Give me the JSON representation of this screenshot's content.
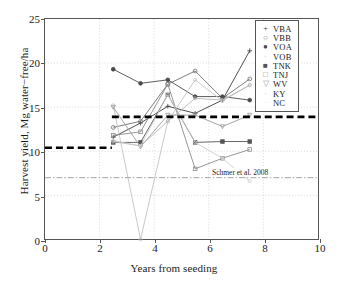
{
  "chart_data": {
    "type": "line",
    "title": "",
    "xlabel": "Years from seeding",
    "ylabel": "Harvest yield, Mg water−free/ha",
    "xlim": [
      0,
      10
    ],
    "ylim": [
      0,
      25
    ],
    "xticks": [
      0,
      2,
      4,
      6,
      8,
      10
    ],
    "yticks": [
      0,
      5,
      10,
      15,
      20,
      25
    ],
    "grid": true,
    "legend_position": "upper right",
    "series": [
      {
        "name": "VBA",
        "marker": "plus",
        "color": "#3a3a3a",
        "x": [
          2.5,
          3.5,
          4.5,
          5.5,
          6.5,
          7.5
        ],
        "y": [
          11.6,
          13.2,
          15.1,
          14.3,
          15.8,
          21.4
        ]
      },
      {
        "name": "VBB",
        "marker": "circle",
        "color": "#6e6e6e",
        "x": [
          2.5,
          3.5,
          4.5,
          5.5,
          6.5,
          7.5
        ],
        "y": [
          12.7,
          13.4,
          17.6,
          19.1,
          16.0,
          18.2
        ]
      },
      {
        "name": "VOA",
        "marker": "circle-filled",
        "color": "#4a4a4a",
        "x": [
          2.5,
          3.5,
          4.5,
          5.5,
          6.5,
          7.5
        ],
        "y": [
          19.3,
          17.7,
          18.1,
          16.2,
          16.2,
          15.8
        ]
      },
      {
        "name": "VOB",
        "marker": "dot",
        "color": "#c2c2c2",
        "x": [
          2.5,
          3.5,
          4.5,
          5.5,
          6.5,
          7.5
        ],
        "y": [
          15.2,
          0.0,
          13.4,
          18.1,
          15.7,
          17.5
        ]
      },
      {
        "name": "TNK",
        "marker": "square",
        "color": "#555555",
        "x": [
          2.5,
          3.5,
          4.5,
          5.5,
          6.5,
          7.5
        ],
        "y": [
          11.0,
          11.0,
          16.4,
          11.0,
          11.1,
          11.1
        ]
      },
      {
        "name": "TNJ",
        "marker": "square-open",
        "color": "#8a8a8a",
        "x": [
          2.5,
          3.5,
          4.5,
          5.5,
          6.5,
          7.5
        ],
        "y": [
          11.8,
          12.2,
          17.6,
          8.0,
          9.2,
          10.2
        ]
      },
      {
        "name": "WV",
        "marker": "triangle-down",
        "color": "#9a9a9a",
        "x": [
          2.5,
          3.5,
          4.5,
          5.5,
          6.5,
          7.5
        ],
        "y": [
          15.0,
          10.5,
          14.1,
          14.1,
          12.8,
          14.1
        ]
      },
      {
        "name": "KY",
        "marker": "dot",
        "color": "#b5b5b5",
        "x": [
          2.5,
          3.5,
          4.5,
          5.5,
          6.5,
          7.5
        ],
        "y": [
          11.1,
          10.6,
          13.4,
          16.0,
          15.8,
          17.5
        ]
      },
      {
        "name": "NC",
        "marker": "dot",
        "color": "#cccccc",
        "x": [
          2.5,
          3.5,
          4.5,
          5.5,
          6.5,
          7.5
        ],
        "y": [
          11.2,
          10.6,
          16.4,
          11.0,
          9.2,
          6.6
        ]
      }
    ],
    "reference_lines": [
      {
        "name": "baseline-low",
        "style": "thick-dashed",
        "y": 10.4,
        "x_start": 0.0,
        "x_end": 2.45,
        "color": "#000000"
      },
      {
        "name": "baseline-high",
        "style": "thick-dashed",
        "y": 13.9,
        "x_start": 2.45,
        "x_end": 10.0,
        "color": "#000000"
      },
      {
        "name": "schmer-2008",
        "style": "dash-dot",
        "y": 7.0,
        "x_start": 0.0,
        "x_end": 10.0,
        "color": "#8d8d8d",
        "label": "Schmer et al. 2008"
      }
    ]
  },
  "legend": {
    "items": [
      {
        "label": "VBA"
      },
      {
        "label": "VBB"
      },
      {
        "label": "VOA"
      },
      {
        "label": "VOB"
      },
      {
        "label": "TNK"
      },
      {
        "label": "TNJ"
      },
      {
        "label": "WV"
      },
      {
        "label": "KY"
      },
      {
        "label": "NC"
      }
    ]
  },
  "annotations": {
    "schmer": "Schmer et al. 2008"
  }
}
